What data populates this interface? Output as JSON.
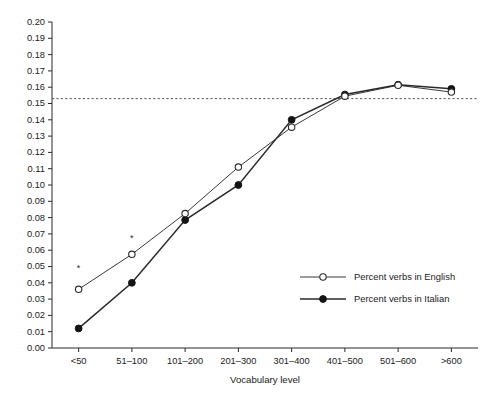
{
  "figure": {
    "cut_off_title": "",
    "background_color": "#ffffff",
    "ink_color": "#1a1a1a"
  },
  "chart_data": {
    "type": "line",
    "title": "",
    "xlabel": "Vocabulary level",
    "ylabel": "",
    "categories": [
      "<50",
      "51–100",
      "101–200",
      "201–300",
      "301–400",
      "401–500",
      "501–600",
      ">600"
    ],
    "series": [
      {
        "name": "Percent verbs in English",
        "marker": "open-circle",
        "color": "#2a2a2a",
        "values": [
          0.036,
          0.0575,
          0.0825,
          0.111,
          0.1355,
          0.1545,
          0.1612,
          0.157
        ]
      },
      {
        "name": "Percent verbs in Italian",
        "marker": "filled-circle",
        "color": "#141414",
        "values": [
          0.012,
          0.04,
          0.0785,
          0.1,
          0.14,
          0.1555,
          0.1615,
          0.159
        ]
      }
    ],
    "ylim": [
      0.0,
      0.2
    ],
    "ytick_step": 0.01,
    "ytick_labels": [
      "0.00",
      "0.01",
      "0.02",
      "0.03",
      "0.04",
      "0.05",
      "0.06",
      "0.07",
      "0.08",
      "0.09",
      "0.10",
      "0.11",
      "0.12",
      "0.13",
      "0.14",
      "0.15",
      "0.16",
      "0.17",
      "0.18",
      "0.19",
      "0.20"
    ],
    "grid": false,
    "legend_position": "inside-lower-right",
    "reference_line": {
      "orientation": "horizontal",
      "value": 0.153,
      "style": "dashed"
    },
    "annotations": [
      {
        "label": "*",
        "category": "<50",
        "value": 0.049,
        "meaning": "significance-marker"
      },
      {
        "label": "*",
        "category": "51–100",
        "value": 0.067,
        "meaning": "significance-marker"
      }
    ]
  },
  "legend": {
    "items": [
      {
        "label": "Percent verbs in English",
        "marker": "open-circle"
      },
      {
        "label": "Percent verbs in Italian",
        "marker": "filled-circle"
      }
    ]
  }
}
